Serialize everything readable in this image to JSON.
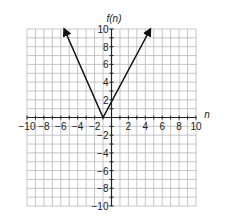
{
  "chart_data": {
    "type": "line",
    "title": "",
    "xlabel": "n",
    "ylabel": "f(n)",
    "xlim": [
      -10,
      10
    ],
    "ylim": [
      -10,
      10
    ],
    "grid": true,
    "x_tick_labels": [
      "-10",
      "-8",
      "-6",
      "-4",
      "-2",
      "2",
      "4",
      "6",
      "8",
      "10"
    ],
    "y_tick_labels": [
      "10",
      "8",
      "6",
      "4",
      "2",
      "-2",
      "-4",
      "-6",
      "-8",
      "-10"
    ],
    "series": [
      {
        "name": "f(n)",
        "description": "absolute value graph (V shape) with vertex at (-1, 0), arrows at both ends",
        "points": [
          [
            -5.6,
            10
          ],
          [
            -1,
            0
          ],
          [
            4.6,
            10
          ]
        ]
      }
    ]
  },
  "labels": {
    "x_axis": "n",
    "y_axis": "f(n)"
  }
}
